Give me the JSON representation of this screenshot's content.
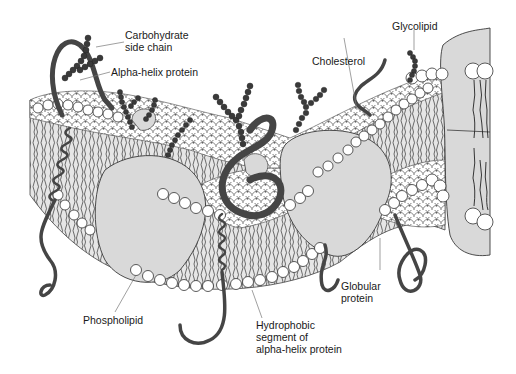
{
  "diagram": {
    "colors": {
      "background": "#ffffff",
      "protein_fill": "#d9d9d9",
      "outline": "#3a3a3a",
      "dark_protein": "#454545",
      "head_fill": "#ffffff",
      "leader_line": "#666666"
    },
    "labels": {
      "carbohydrate": "Carbohydrate\nside chain",
      "alpha_helix": "Alpha-helix protein",
      "glycolipid": "Glycolipid",
      "cholesterol": "Cholesterol",
      "globular": "Globular\nprotein",
      "phospholipid": "Phospholipid",
      "hydrophobic": "Hydrophobic\nsegment of\nalpha-helix protein"
    },
    "components": [
      "carbohydrate-side-chain",
      "alpha-helix-protein",
      "glycolipid",
      "cholesterol",
      "globular-protein",
      "phospholipid",
      "hydrophobic-segment"
    ]
  }
}
